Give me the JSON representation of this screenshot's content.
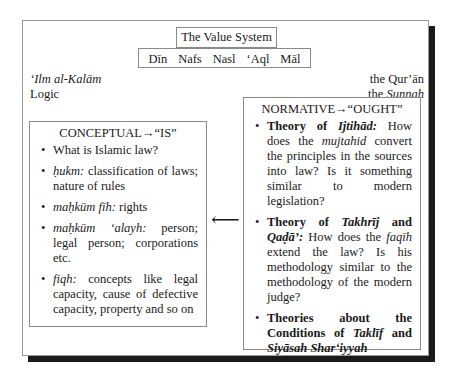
{
  "title": "The Value System",
  "pillars": [
    "Dīn",
    "Nafs",
    "Nasl",
    "ʻAql",
    "Māl"
  ],
  "left_labels": {
    "line1": "ʻIlm al-Kalām",
    "line2": "Logic"
  },
  "right_labels": {
    "line1": "the Qur’ān",
    "line2_prefix": "the ",
    "line2_italic": "Sunnah"
  },
  "conceptual": {
    "heading": "CONCEPTUAL→“IS”",
    "items": [
      {
        "term": "",
        "text": "What is Islamic law?"
      },
      {
        "term": "ḥukm:",
        "text": " classification of laws; nature of rules"
      },
      {
        "term": "maḥkūm fīh:",
        "text": " rights"
      },
      {
        "term": "maḥkūm ʻalayh:",
        "text": " person; legal person; corporations etc."
      },
      {
        "term": "fiqh:",
        "text": " concepts like legal capacity, cause of defective capacity, property and so on"
      }
    ]
  },
  "arrow": "⟵",
  "normative": {
    "heading": "NORMATIVE→“OUGHT”",
    "items": [
      {
        "bold": "Theory of ",
        "bold_italic": "Ijtihād:",
        "text_a": " How does the ",
        "italic": "mujtahid",
        "text_b": " convert the principles in the sources into law? Is it something similar to modern legislation?"
      },
      {
        "bold": "Theory of ",
        "bold_italic": "Takhrīj",
        "bold2": " and ",
        "bold_italic2": "Qaḍā’:",
        "text_a": " How does the ",
        "italic": "faqīh",
        "text_b": " extend the law? Is his methodology similar to the methodology of the modern judge?"
      },
      {
        "bold": "Theories about the Conditions of ",
        "bold_italic": "Taklīf",
        "bold2": " and ",
        "bold_italic2": "Siyāsah Sharʻiyyah"
      }
    ]
  }
}
